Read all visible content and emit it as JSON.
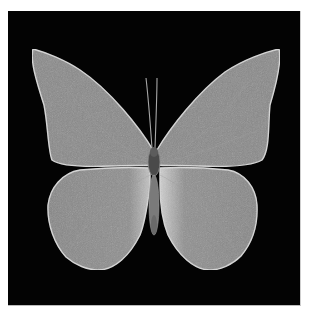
{
  "image": {
    "subject": "butterfly specimen",
    "background_color": "#030303",
    "wing_color": "#8a8a8a",
    "wing_edge_color": "#d8d8d8",
    "body_color": "#6a6a6a"
  }
}
